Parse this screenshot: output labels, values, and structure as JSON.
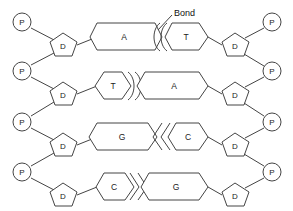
{
  "diagram": {
    "background_color": "#ffffff",
    "line_color": "#444444",
    "text_color": "#222222",
    "width": 293,
    "height": 211
  },
  "annotation": {
    "label": "Bond",
    "leader_from": [
      172,
      16
    ],
    "leader_to": [
      155,
      30
    ]
  },
  "legend_symbols": {
    "phosphate": "P",
    "deoxyribose": "D"
  },
  "rungs": [
    {
      "index": 0,
      "y": 33,
      "left_phosphate": "P",
      "left_sugar": "D",
      "right_phosphate": "P",
      "right_sugar": "D",
      "left_base": "A",
      "right_base": "T",
      "left_base_long": true,
      "right_base_long": false,
      "bond_type": "double-arc-left",
      "bond_count": 2
    },
    {
      "index": 1,
      "y": 82,
      "left_phosphate": "P",
      "left_sugar": "D",
      "right_phosphate": "P",
      "right_sugar": "D",
      "left_base": "T",
      "right_base": "A",
      "left_base_long": false,
      "right_base_long": true,
      "bond_type": "double-arc-right",
      "bond_count": 2
    },
    {
      "index": 2,
      "y": 133,
      "left_phosphate": "P",
      "left_sugar": "D",
      "right_phosphate": "P",
      "right_sugar": "D",
      "left_base": "G",
      "right_base": "C",
      "left_base_long": true,
      "right_base_long": false,
      "bond_type": "double-chevron-left",
      "bond_count": 2
    },
    {
      "index": 3,
      "y": 182,
      "left_phosphate": "P",
      "left_sugar": "D",
      "right_phosphate": "P",
      "right_sugar": "D",
      "left_base": "C",
      "right_base": "G",
      "left_base_long": false,
      "right_base_long": true,
      "bond_type": "double-chevron-right",
      "bond_count": 2
    }
  ]
}
